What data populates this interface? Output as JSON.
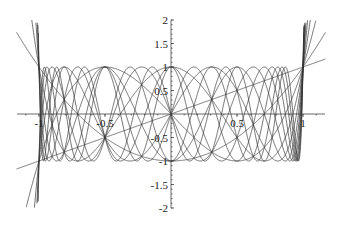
{
  "chart_data": {
    "type": "line",
    "title": "",
    "xlabel": "",
    "ylabel": "",
    "xlim": [
      -1.17,
      1.17
    ],
    "ylim": [
      -2,
      2
    ],
    "grid": false,
    "legend": null,
    "x_ticks": [
      -1,
      -0.5,
      0.5,
      1
    ],
    "x_tick_labels": [
      "-1",
      "-0.5",
      "0.5",
      "1"
    ],
    "y_ticks": [
      2,
      1.5,
      1,
      0.5,
      -0.5,
      -1,
      -1.5,
      -2
    ],
    "y_tick_labels": [
      "2",
      "1.5",
      "1",
      "0.5",
      "-0.5",
      "-1",
      "-1.5",
      "-2"
    ],
    "series": [
      {
        "name": "T1",
        "n": 1
      },
      {
        "name": "T2",
        "n": 2
      },
      {
        "name": "T3",
        "n": 3
      },
      {
        "name": "T4",
        "n": 4
      },
      {
        "name": "T5",
        "n": 5
      },
      {
        "name": "T6",
        "n": 6
      },
      {
        "name": "T7",
        "n": 7
      },
      {
        "name": "T8",
        "n": 8
      },
      {
        "name": "T9",
        "n": 9
      },
      {
        "name": "T10",
        "n": 10
      },
      {
        "name": "T11",
        "n": 11
      },
      {
        "name": "T12",
        "n": 12
      }
    ],
    "color": "#333333"
  }
}
